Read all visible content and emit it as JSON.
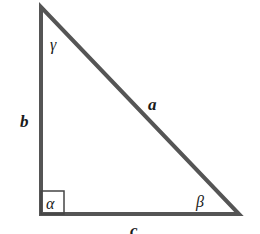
{
  "diagram": {
    "type": "right-triangle",
    "stroke_color": "#555555",
    "vertices": {
      "top": {
        "x": 41,
        "y": 7
      },
      "bottom_left": {
        "x": 41,
        "y": 214
      },
      "bottom_right": {
        "x": 239,
        "y": 214
      }
    },
    "sides": {
      "a": "a",
      "b": "b",
      "c": "c"
    },
    "angles": {
      "alpha": "α",
      "beta": "β",
      "gamma": "γ"
    },
    "right_angle_at": "alpha"
  }
}
